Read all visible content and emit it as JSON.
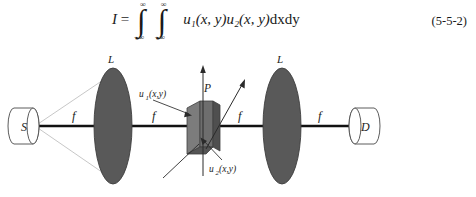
{
  "equation": {
    "lhs": "I",
    "equals": "=",
    "integral_symbol": "∫",
    "upper_limit": "∞",
    "lower_limit": "−∞",
    "integrand_u1": "u",
    "integrand_u1_sub": "1",
    "integrand_u1_args": "(x, y)",
    "integrand_u2": "u",
    "integrand_u2_sub": "2",
    "integrand_u2_args": "(x, y)",
    "differentials": "dxdy",
    "number": "(5-5-2)"
  },
  "figure": {
    "source_label": "S",
    "detector_label": "D",
    "lens_left_label": "L",
    "lens_right_label": "L",
    "plate_label": "P",
    "focal_labels": [
      "f",
      "f",
      "f",
      "f"
    ],
    "wave_label_1": "u",
    "wave_label_1_sub": "1",
    "wave_label_1_args": "(x,y)",
    "wave_label_2": "u",
    "wave_label_2_sub": "2",
    "wave_label_2_args": "(x,y)",
    "colors": {
      "lens_fill": "#595959",
      "lens_stroke": "#3d3d3d",
      "plate_front": "#6e6e6e",
      "plate_side": "#4f4f4f",
      "plate_top": "#8a8a8a",
      "axis": "#111111",
      "ray": "#b9b9b9",
      "outline": "#4a4a4a",
      "text": "#222222"
    }
  }
}
